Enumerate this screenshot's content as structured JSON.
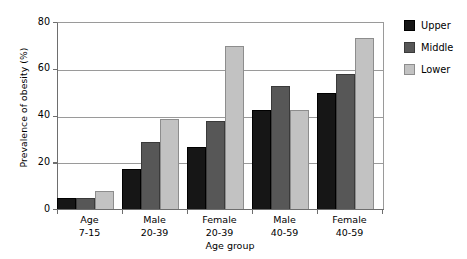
{
  "chart_data": {
    "type": "bar",
    "title": "",
    "xlabel": "Age group",
    "ylabel": "Prevalence of obesity (%)",
    "ylim": [
      0,
      80
    ],
    "yticks": [
      0,
      20,
      40,
      60,
      80
    ],
    "ytick_labels": [
      "0",
      "20",
      "40",
      "60",
      "80"
    ],
    "grid": "horizontal",
    "legend_position": "right",
    "categories": [
      "Age\n7-15",
      "Male\n20-39",
      "Female\n20-39",
      "Male\n40-59",
      "Female\n40-59"
    ],
    "category_lines": [
      [
        "Age",
        "7-15"
      ],
      [
        "Male",
        "20-39"
      ],
      [
        "Female",
        "20-39"
      ],
      [
        "Male",
        "40-59"
      ],
      [
        "Female",
        "40-59"
      ]
    ],
    "series": [
      {
        "name": "Upper",
        "color": "#161616",
        "values": [
          5,
          17.5,
          27,
          43,
          50
        ]
      },
      {
        "name": "Middle",
        "color": "#575757",
        "values": [
          5,
          29,
          38,
          53,
          58
        ]
      },
      {
        "name": "Lower",
        "color": "#c2c2c2",
        "values": [
          8,
          39,
          70,
          43,
          73.5
        ]
      }
    ]
  },
  "legend": {
    "entries": [
      {
        "label": "Upper"
      },
      {
        "label": "Middle"
      },
      {
        "label": "Lower"
      }
    ]
  }
}
